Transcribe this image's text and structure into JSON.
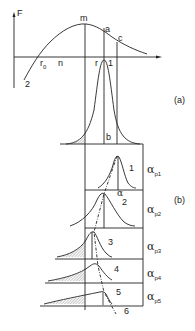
{
  "diagram": {
    "panel_a": {
      "label": "(a)",
      "axis_label": "F",
      "points": {
        "m": "m",
        "a": "a",
        "c": "c",
        "r0": "r",
        "r0_sub": "0",
        "n": "n",
        "r": "r",
        "curve_1": "1",
        "curve_2": "2",
        "b": "b"
      }
    },
    "panel_b": {
      "label": "(b)",
      "alpha": "α",
      "rows": [
        {
          "alpha": "α",
          "sub": "p1",
          "curve": "1"
        },
        {
          "alpha": "α",
          "sub": "p2",
          "curve": "2"
        },
        {
          "alpha": "α",
          "sub": "p3",
          "curve": "3"
        },
        {
          "alpha": "α",
          "sub": "p4",
          "curve": "4"
        },
        {
          "alpha": "α",
          "sub": "p5",
          "curve": "5"
        }
      ],
      "extra_curve": "6"
    },
    "colors": {
      "line": "#222222",
      "hatch": "#888888"
    }
  }
}
